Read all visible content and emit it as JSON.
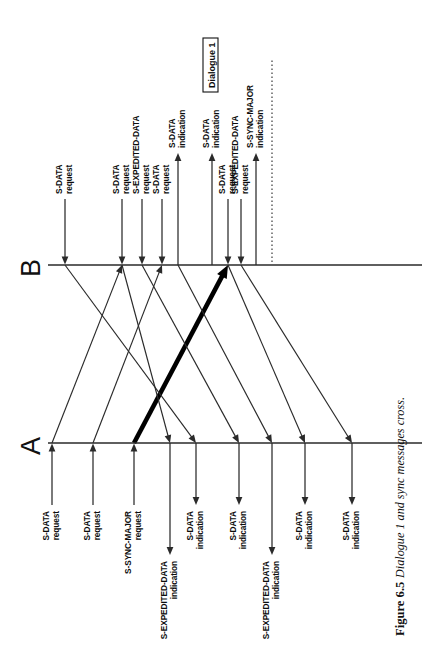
{
  "figure": {
    "caption_number": "Figure 6.5",
    "caption_text": "Dialogue 1 and sync messages cross.",
    "endpoint_a_label": "A",
    "endpoint_b_label": "B",
    "annotation_box_label": "Dialogue 1"
  },
  "diagram": {
    "type": "sequence-timing-diagram",
    "orientation": "rotated-90-ccw",
    "axis_a_y": 443,
    "axis_b_y": 265,
    "axis_x_start": 48,
    "axis_x_end": 378,
    "dotted_marker_x": 272,
    "a_events": [
      {
        "id": "a1",
        "x": 52,
        "dir": "out",
        "name": "S-DATA",
        "kind": "request"
      },
      {
        "id": "a2",
        "x": 93,
        "dir": "out",
        "name": "S-DATA",
        "kind": "request"
      },
      {
        "id": "a3",
        "x": 134,
        "dir": "out",
        "name": "S-SYNC-MAJOR",
        "kind": "request"
      },
      {
        "id": "a4",
        "x": 170,
        "dir": "in",
        "name": "S-EXPEDITED-DATA",
        "kind": "indication"
      },
      {
        "id": "a5",
        "x": 196,
        "dir": "in",
        "name": "S-DATA",
        "kind": "indication"
      },
      {
        "id": "a6",
        "x": 239,
        "dir": "in",
        "name": "S-DATA",
        "kind": "indication"
      },
      {
        "id": "a7",
        "x": 272,
        "dir": "in",
        "name": "S-EXPEDITED-DATA",
        "kind": "indication"
      },
      {
        "id": "a8",
        "x": 305,
        "dir": "in",
        "name": "S-DATA",
        "kind": "indication"
      },
      {
        "id": "a9",
        "x": 352,
        "dir": "in",
        "name": "S-DATA",
        "kind": "indication"
      }
    ],
    "b_events": [
      {
        "id": "b1",
        "x": 65,
        "dir": "in",
        "name": "S-DATA",
        "kind": "request"
      },
      {
        "id": "b2",
        "x": 122,
        "dir": "in",
        "name": "S-DATA",
        "kind": "request"
      },
      {
        "id": "b3",
        "x": 142,
        "dir": "in",
        "name": "S-EXPEDITED-DATA",
        "kind": "request"
      },
      {
        "id": "b4",
        "x": 162,
        "dir": "in",
        "name": "S-DATA",
        "kind": "request"
      },
      {
        "id": "b5",
        "x": 178,
        "dir": "out",
        "name": "S-DATA",
        "kind": "indication"
      },
      {
        "id": "b6",
        "x": 212,
        "dir": "out",
        "name": "S-DATA",
        "kind": "indication"
      },
      {
        "id": "b7",
        "x": 228,
        "dir": "in",
        "name": "S-DATA",
        "kind": "request"
      },
      {
        "id": "b8",
        "x": 241,
        "dir": "in",
        "name": "S-EXPEDITED-DATA",
        "kind": "request"
      },
      {
        "id": "b9",
        "x": 256,
        "dir": "out",
        "name": "S-SYNC-MAJOR",
        "kind": "indication"
      }
    ],
    "messages": [
      {
        "id": "m1",
        "from": "a",
        "fx": 52,
        "to": "b",
        "tx": 122,
        "weight": "normal"
      },
      {
        "id": "m2",
        "from": "a",
        "fx": 93,
        "to": "b",
        "tx": 162,
        "weight": "normal"
      },
      {
        "id": "m3",
        "from": "a",
        "fx": 134,
        "to": "b",
        "tx": 228,
        "weight": "bold"
      },
      {
        "id": "m4",
        "from": "b",
        "fx": 65,
        "to": "a",
        "tx": 196,
        "weight": "normal"
      },
      {
        "id": "m5",
        "from": "b",
        "fx": 122,
        "to": "a",
        "tx": 170,
        "weight": "normal"
      },
      {
        "id": "m6",
        "from": "b",
        "fx": 142,
        "to": "a",
        "tx": 239,
        "weight": "normal"
      },
      {
        "id": "m7",
        "from": "b",
        "fx": 178,
        "to": "a",
        "tx": 272,
        "weight": "normal"
      },
      {
        "id": "m8",
        "from": "b",
        "fx": 228,
        "to": "a",
        "tx": 305,
        "weight": "normal"
      },
      {
        "id": "m9",
        "from": "b",
        "fx": 241,
        "to": "a",
        "tx": 352,
        "weight": "normal"
      }
    ]
  }
}
